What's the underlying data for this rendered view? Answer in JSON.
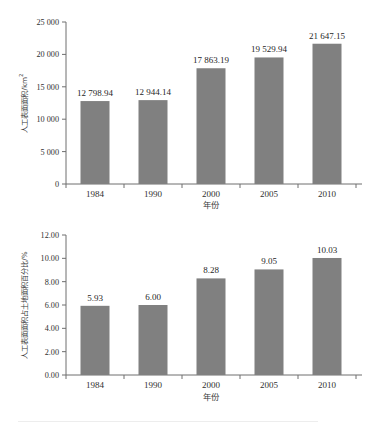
{
  "page": {
    "background": "#ffffff",
    "bar_color": "#808080",
    "axis_color": "#6e6e6e"
  },
  "chart_data": [
    {
      "id": "artificial-surface-area",
      "type": "bar",
      "title": "",
      "xlabel": "年份",
      "ylabel": "人工表面面积/km",
      "ylabel_superscript": "2",
      "ylabel_full": "人工表面面积/km²",
      "categories": [
        "1984",
        "1990",
        "2000",
        "2005",
        "2010"
      ],
      "values": [
        12798.94,
        12944.14,
        17863.19,
        19529.94,
        21647.15
      ],
      "value_labels": [
        "12 798.94",
        "12 944.14",
        "17 863.19",
        "19 529.94",
        "21 647.15"
      ],
      "ylim": [
        0,
        25000
      ],
      "ytick_values": [
        0,
        5000,
        10000,
        15000,
        20000,
        25000
      ],
      "ytick_labels": [
        "0",
        "5 000",
        "10 000",
        "15 000",
        "20 000",
        "25 000"
      ],
      "grid": false,
      "legend": "none"
    },
    {
      "id": "artificial-surface-percentage",
      "type": "bar",
      "title": "",
      "xlabel": "年份",
      "ylabel": "人工表面面积占土地面积百分比/%",
      "ylabel_full": "人工表面面积占土地面积百分比/%",
      "categories": [
        "1984",
        "1990",
        "2000",
        "2005",
        "2010"
      ],
      "values": [
        5.93,
        6.0,
        8.28,
        9.05,
        10.03
      ],
      "value_labels": [
        "5.93",
        "6.00",
        "8.28",
        "9.05",
        "10.03"
      ],
      "ylim": [
        0,
        12
      ],
      "ytick_values": [
        0,
        2,
        4,
        6,
        8,
        10,
        12
      ],
      "ytick_labels": [
        "0.00",
        "2.00",
        "4.00",
        "6.00",
        "8.00",
        "10.00",
        "12.00"
      ],
      "grid": false,
      "legend": "none"
    }
  ]
}
